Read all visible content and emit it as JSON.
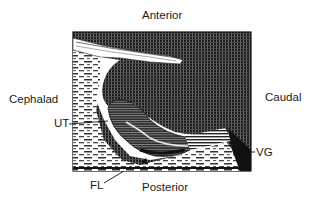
{
  "orientation": {
    "top": "Anterior",
    "bottom": "Posterior",
    "left": "Cephalad",
    "right": "Caudal"
  },
  "structures": [
    {
      "abbr": "UT",
      "side": "left"
    },
    {
      "abbr": "VG",
      "side": "right"
    },
    {
      "abbr": "FL",
      "side": "bottom-left"
    }
  ],
  "colors": {
    "ink": "#141414",
    "paper": "#ffffff",
    "mid": "#5a5a5a"
  }
}
